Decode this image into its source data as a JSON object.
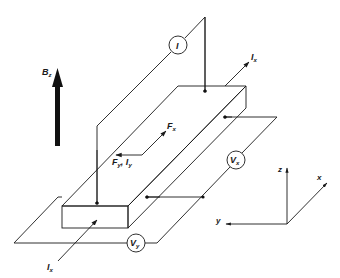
{
  "diagram": {
    "magnetic_field": {
      "symbol": "B",
      "subscript": "z"
    },
    "current_meter": {
      "symbol": "I"
    },
    "current_in": {
      "symbol": "I",
      "subscript": "x"
    },
    "current_out": {
      "symbol": "I",
      "subscript": "x"
    },
    "force_x": {
      "symbol": "F",
      "subscript": "x"
    },
    "force_y": {
      "symbol": "F",
      "subscript": "y",
      "separator": ", ",
      "symbol2": "I",
      "subscript2": "y"
    },
    "voltmeter_x": {
      "symbol": "V",
      "subscript": "x"
    },
    "voltmeter_y": {
      "symbol": "V",
      "subscript": "y"
    },
    "axes": {
      "x": "x",
      "y": "y",
      "z": "z"
    },
    "colors": {
      "line": "#1a1a1a",
      "background": "#ffffff"
    }
  }
}
